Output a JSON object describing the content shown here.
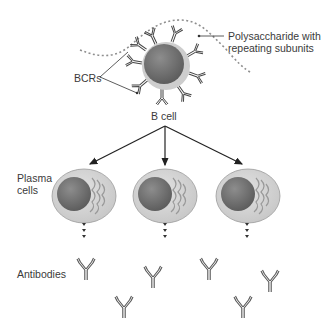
{
  "diagram": {
    "title": "",
    "labels": {
      "polysaccharide": [
        "Polysaccharide with",
        "repeating subunits"
      ],
      "bcrs": "BCRs",
      "b_cell": "B cell",
      "plasma_cells": [
        "Plasma",
        "cells"
      ],
      "antibodies": "Antibodies"
    },
    "nodes": [
      {
        "id": "polysaccharide",
        "label": "Polysaccharide with repeating subunits"
      },
      {
        "id": "bcrs",
        "label": "BCRs"
      },
      {
        "id": "b-cell",
        "label": "B cell"
      },
      {
        "id": "plasma-cell-1",
        "label": "Plasma cells"
      },
      {
        "id": "plasma-cell-2",
        "label": "Plasma cells"
      },
      {
        "id": "plasma-cell-3",
        "label": "Plasma cells"
      },
      {
        "id": "antibodies",
        "label": "Antibodies"
      }
    ],
    "edges": [
      {
        "from": "b-cell",
        "to": "plasma-cell-1"
      },
      {
        "from": "b-cell",
        "to": "plasma-cell-2"
      },
      {
        "from": "b-cell",
        "to": "plasma-cell-3"
      },
      {
        "from": "plasma-cell-1",
        "to": "antibodies",
        "style": "dotted"
      },
      {
        "from": "plasma-cell-2",
        "to": "antibodies",
        "style": "dotted"
      },
      {
        "from": "plasma-cell-3",
        "to": "antibodies",
        "style": "dotted"
      }
    ],
    "colors": {
      "nucleus": "#6e6e6e",
      "cytoplasm": "#cfcfcf",
      "cell_outline": "#8a8a8a",
      "line": "#222222",
      "polysaccharide": "#8f8f8f"
    }
  }
}
